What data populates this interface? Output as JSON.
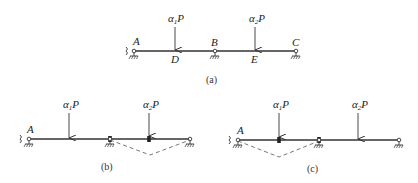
{
  "figure": {
    "a": {
      "caption": "(a)",
      "nodes": {
        "A": "A",
        "B": "B",
        "C": "C",
        "D": "D",
        "E": "E"
      },
      "loads": [
        {
          "symbol": "α",
          "subscript": "1",
          "suffix": "P"
        },
        {
          "symbol": "α",
          "subscript": "2",
          "suffix": "P"
        }
      ]
    },
    "b": {
      "caption": "(b)",
      "nodes": {
        "A": "A"
      },
      "loads": [
        {
          "symbol": "α",
          "subscript": "1",
          "suffix": "P"
        },
        {
          "symbol": "α",
          "subscript": "2",
          "suffix": "P"
        }
      ]
    },
    "c": {
      "caption": "(c)",
      "nodes": {
        "A": "A"
      },
      "loads": [
        {
          "symbol": "α",
          "subscript": "1",
          "suffix": "P"
        },
        {
          "symbol": "α",
          "subscript": "2",
          "suffix": "P"
        }
      ]
    }
  },
  "colors": {
    "line": "#333333",
    "dashed": "#666666"
  }
}
